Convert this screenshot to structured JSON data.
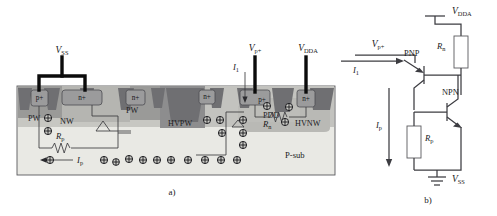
{
  "figure": {
    "panel_a_label": "a)",
    "panel_b_label": "b)"
  },
  "cross_section": {
    "terminals": [
      {
        "name": "vss",
        "base": "V",
        "sub": "SS"
      },
      {
        "name": "vp",
        "base": "V",
        "sub": "p+"
      },
      {
        "name": "vdda",
        "base": "V",
        "sub": "DDA"
      }
    ],
    "currents": [
      {
        "name": "i1",
        "base": "I",
        "sub": "1"
      },
      {
        "name": "ip",
        "base": "I",
        "sub": "p"
      }
    ],
    "resistors": [
      {
        "name": "rp",
        "base": "R",
        "sub": "p"
      },
      {
        "name": "rn",
        "base": "R",
        "sub": "n"
      }
    ],
    "diffusions": [
      {
        "label": "p+"
      },
      {
        "label": "n+"
      },
      {
        "label": "n+"
      },
      {
        "label": "n+"
      },
      {
        "label": "p+"
      },
      {
        "label": "n+"
      }
    ],
    "wells": [
      {
        "label": "PW"
      },
      {
        "label": "NW"
      },
      {
        "label": "PW"
      },
      {
        "label": "HVPW"
      },
      {
        "label": "PDD"
      },
      {
        "label": "HVNW"
      }
    ],
    "substrate_label": "P-sub",
    "colors": {
      "substrate": "#e9e9e4",
      "deep_well": "#8d8d8e",
      "mid_well": "#a9a9a6",
      "light_well": "#c7c7c2",
      "diffusion": "#9b9b9c",
      "sti": "#6f6f72",
      "outline": "#5a5a5e",
      "wire": "#3b3b3f",
      "metal": "#0b0b0b"
    }
  },
  "circuit": {
    "nodes": [
      {
        "name": "vdda",
        "base": "V",
        "sub": "DDA"
      },
      {
        "name": "vp",
        "base": "V",
        "sub": "p+"
      },
      {
        "name": "vss",
        "base": "V",
        "sub": "SS"
      }
    ],
    "currents": [
      {
        "name": "i1",
        "base": "I",
        "sub": "1"
      },
      {
        "name": "ip",
        "base": "I",
        "sub": "p"
      }
    ],
    "resistors": [
      {
        "name": "rn",
        "base": "R",
        "sub": "n"
      },
      {
        "name": "rp",
        "base": "R",
        "sub": "p"
      }
    ],
    "transistors": [
      {
        "name": "pnp",
        "label": "PNP"
      },
      {
        "name": "npn",
        "label": "NPN"
      }
    ]
  }
}
